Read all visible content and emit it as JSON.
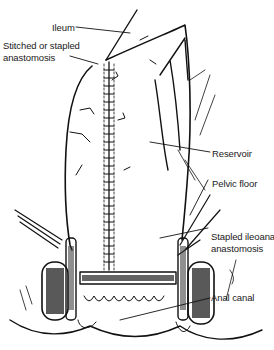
{
  "diagram": {
    "labels": {
      "ileum": "Ileum",
      "stitched_line1": "Stitched or stapled",
      "stitched_line2": "anastomosis",
      "reservoir": "Reservoir",
      "pelvic_floor": "Pelvic floor",
      "stapled_line1": "Stapled ileoanal",
      "stapled_line2": "anastomosis",
      "anal_canal": "Anal canal"
    },
    "colors": {
      "line": "#111111",
      "background": "#ffffff",
      "text": "#1a1a1a"
    }
  }
}
